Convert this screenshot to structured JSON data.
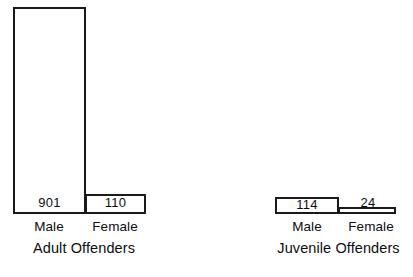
{
  "chart_data": {
    "type": "bar",
    "title": "",
    "subtitle": "",
    "xlabel": "",
    "ylabel": "",
    "grid": false,
    "legend": "none",
    "orientation": "vertical",
    "note": "Two separate bar groups, each drawn to its own vertical scale; bars are white with black outlines and the value printed inside or above each bar.",
    "groups": [
      {
        "name": "Adult Offenders",
        "categories": [
          "Male",
          "Female"
        ],
        "values": [
          901,
          110
        ]
      },
      {
        "name": "Juvenile Offenders",
        "categories": [
          "Male",
          "Female"
        ],
        "values": [
          114,
          24
        ]
      }
    ],
    "categories": [
      "Adult Male",
      "Adult Female",
      "Juvenile Male",
      "Juvenile Female"
    ],
    "values": [
      901,
      110,
      114,
      24
    ],
    "colors": {
      "bar_fill": "#ffffff",
      "bar_stroke": "#1a1a1a",
      "text": "#0d0d0d",
      "background": "#ffffff"
    }
  },
  "adult": {
    "group_label": "Adult Offenders",
    "male": {
      "value": "901",
      "category": "Male"
    },
    "female": {
      "value": "110",
      "category": "Female"
    }
  },
  "juvenile": {
    "group_label": "Juvenile Offenders",
    "male": {
      "value": "114",
      "category": "Male"
    },
    "female": {
      "value": "24",
      "category": "Female"
    }
  },
  "caption": {
    "partial_text": ""
  }
}
